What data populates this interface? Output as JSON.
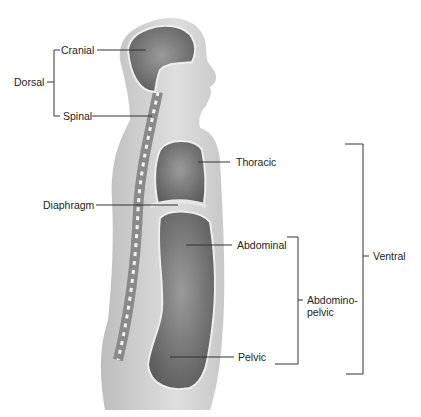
{
  "diagram": {
    "labels": {
      "dorsal": "Dorsal",
      "cranial": "Cranial",
      "spinal": "Spinal",
      "thoracic": "Thoracic",
      "diaphragm": "Diaphragm",
      "abdominal": "Abdominal",
      "abdominopelvic_line1": "Abdomino-",
      "abdominopelvic_line2": "pelvic",
      "pelvic": "Pelvic",
      "ventral": "Ventral"
    },
    "colors": {
      "body_outer": "#b9b9b9",
      "body_inner": "#dcdcdc",
      "cavity": "#7a7a7a",
      "lines": "#333333"
    }
  }
}
